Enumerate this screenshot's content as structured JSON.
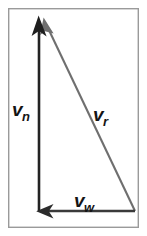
{
  "figure": {
    "background_color": "#ffffff",
    "frame": {
      "name": "figure-border",
      "color": "#9a9a9a",
      "stroke_width": 1.4,
      "x": 8,
      "y": 8,
      "width": 131,
      "height": 220
    }
  },
  "vectors": [
    {
      "id": "vn",
      "label_base": "v",
      "label_sub": "n",
      "description": "vertical vector pointing up",
      "color": "#232323",
      "stroke_width": 2.6,
      "x1": 39,
      "y1": 211,
      "x2": 39,
      "y2": 22,
      "arrowhead": "up"
    },
    {
      "id": "vr",
      "label_base": "v",
      "label_sub": "r",
      "description": "resultant diagonal vector pointing up-left",
      "color": "#6f6f6f",
      "stroke_width": 2.2,
      "x1": 135,
      "y1": 211,
      "x2": 46,
      "y2": 24,
      "arrowhead": "up-left"
    },
    {
      "id": "vw",
      "label_base": "v",
      "label_sub": "w",
      "description": "horizontal vector pointing left",
      "color": "#3a3a3a",
      "stroke_width": 2.6,
      "x1": 135,
      "y1": 211,
      "x2": 44,
      "y2": 211,
      "arrowhead": "left"
    }
  ],
  "labels": {
    "vn": {
      "base": "v",
      "sub": "n"
    },
    "vr": {
      "base": "v",
      "sub": "r"
    },
    "vw": {
      "base": "v",
      "sub": "w"
    }
  }
}
